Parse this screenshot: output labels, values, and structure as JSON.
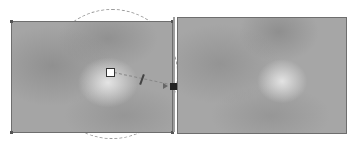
{
  "editor": {
    "left_panel": {
      "role": "original-image-with-gradient-overlay"
    },
    "right_panel": {
      "role": "preview-image"
    },
    "controls": {
      "center_handle": "center-handle",
      "radius_circle": "radius-guide",
      "angle_handle": "angle-handle",
      "end_handle": "end-handle"
    }
  }
}
